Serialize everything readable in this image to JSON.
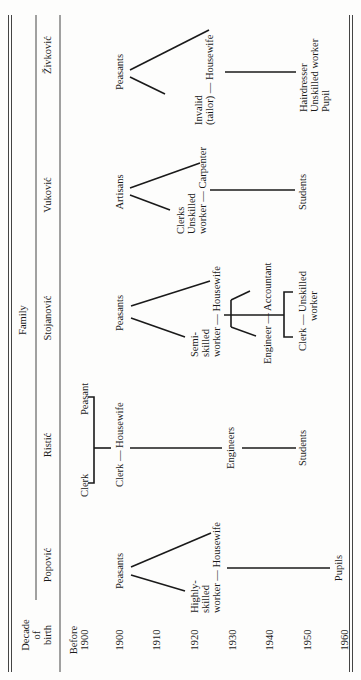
{
  "header": {
    "decade_label": [
      "Decade",
      "of",
      "birth"
    ],
    "family_label": "Family",
    "families": [
      "Popović",
      "Ristić",
      "Stojanović",
      "Vuković",
      "Živković"
    ]
  },
  "decades": [
    "Before 1900",
    "1900",
    "1910",
    "1920",
    "1930",
    "1940",
    "1950",
    "1960"
  ],
  "decade_lines": {
    "before_1900": [
      "Before",
      "1900"
    ]
  },
  "popovic": {
    "parents": "Peasants",
    "child": [
      "Highly-",
      "skilled",
      "worker — Housewife"
    ],
    "grandchildren": "Pupils"
  },
  "ristic": {
    "grandparent_left": "Clerk",
    "grandparent_right": "Peasant",
    "couple": "Clerk — Housewife",
    "children": "Engineers",
    "grandchildren": "Students"
  },
  "stojanovic": {
    "parents": "Peasants",
    "child": [
      "Semi-",
      "skilled",
      "worker — Housewife"
    ],
    "child_couple_1": "Engineer — Accountant",
    "child_couple_2": [
      "Clerk — Unskilled",
      "worker"
    ]
  },
  "vukovic": {
    "parents": "Artisans",
    "child": [
      "Clerks",
      "Unskilled",
      "worker — Carpenter"
    ],
    "grandchildren": "Students"
  },
  "zivkovic": {
    "parents": "Peasants",
    "child": [
      "Invalid",
      "(tailor) — Housewife"
    ],
    "grandchildren": [
      "Hairdresser",
      "Unskilled worker",
      "Pupil"
    ]
  }
}
